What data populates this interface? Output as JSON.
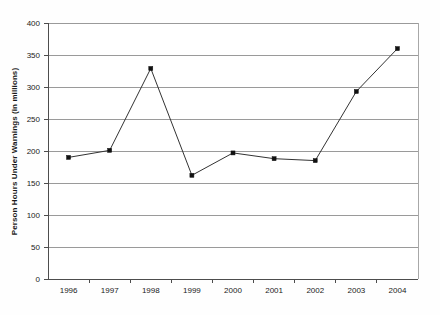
{
  "chart_data": {
    "type": "line",
    "title": "",
    "xlabel": "",
    "ylabel": "Person Hours Under Warnings (in millions)",
    "categories": [
      "1996",
      "1997",
      "1998",
      "1999",
      "2000",
      "2001",
      "2002",
      "2003",
      "2004"
    ],
    "values": [
      190,
      201,
      329,
      162,
      197,
      188,
      185,
      293,
      360
    ],
    "series": [
      {
        "name": "Person Hours Under Warnings",
        "values": [
          190,
          201,
          329,
          162,
          197,
          188,
          185,
          293,
          360
        ]
      }
    ],
    "ylim": [
      0,
      400
    ],
    "ytick_labels": [
      "0",
      "50",
      "100",
      "150",
      "200",
      "250",
      "300",
      "350",
      "400"
    ],
    "ytick_values": [
      0,
      50,
      100,
      150,
      200,
      250,
      300,
      350,
      400
    ],
    "grid": "horizontal",
    "legend": "none",
    "marker": "square",
    "colors": {
      "line": "#333333",
      "marker": "#111111",
      "gridline": "#9a9a9a",
      "axis": "#4d4d4d",
      "background": "#fefefe",
      "text": "#1a1a1a"
    }
  }
}
